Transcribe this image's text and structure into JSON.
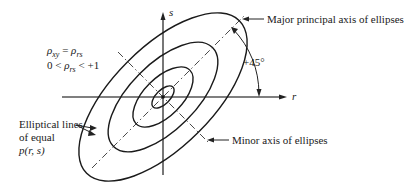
{
  "diagram": {
    "axes": {
      "horizontal_label": "r",
      "vertical_label": "s"
    },
    "equations": {
      "line1_lhs_symbol": "ρ",
      "line1_lhs_sub": "xy",
      "line1_eq": " = ",
      "line1_rhs_symbol": "ρ",
      "line1_rhs_sub": "rs",
      "line2_prefix": "0 < ",
      "line2_symbol": "ρ",
      "line2_sub": "rs",
      "line2_suffix": " < +1"
    },
    "annotations": {
      "major_axis": "Major principal axis of ellipses",
      "minor_axis": "Minor axis of ellipses",
      "angle": "+45°",
      "elliptical_lines_1": "Elliptical lines",
      "elliptical_lines_2": "of equal",
      "elliptical_lines_3": "p(r, s)"
    },
    "ellipse_count": 4,
    "colors": {
      "line": "#1a1a1a",
      "axis": "#555555"
    }
  }
}
